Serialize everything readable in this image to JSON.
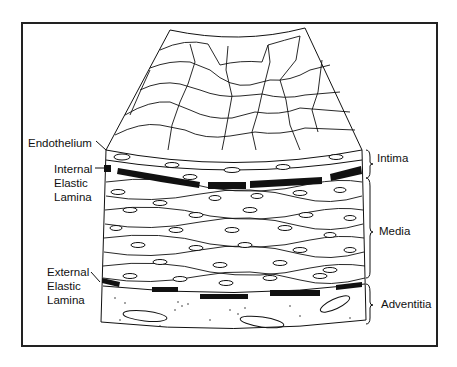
{
  "figure": {
    "left_labels": [
      {
        "id": "endothelium",
        "text": "Endothelium"
      },
      {
        "id": "internal_elastic_lamina",
        "lines": [
          "Internal",
          "Elastic",
          "Lamina"
        ]
      },
      {
        "id": "external_elastic_lamina",
        "lines": [
          "External",
          "Elastic",
          "Lamina"
        ]
      }
    ],
    "right_labels": [
      {
        "id": "intima",
        "text": "Intima"
      },
      {
        "id": "media",
        "text": "Media"
      },
      {
        "id": "adventitia",
        "text": "Adventitia"
      }
    ],
    "colors": {
      "ink": "#111111",
      "background": "#ffffff",
      "frame": "#222222"
    }
  }
}
